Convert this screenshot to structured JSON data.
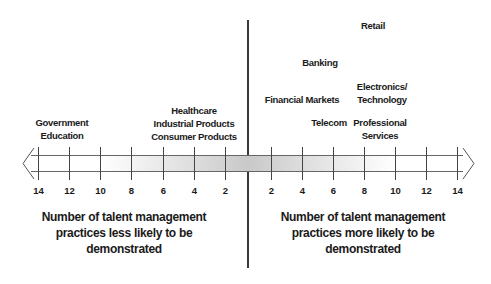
{
  "diagram": {
    "center_line_x": 248,
    "axis": {
      "left_ticks": [
        {
          "label": "14",
          "x": 38
        },
        {
          "label": "12",
          "x": 69
        },
        {
          "label": "10",
          "x": 100
        },
        {
          "label": "8",
          "x": 131
        },
        {
          "label": "6",
          "x": 163
        },
        {
          "label": "4",
          "x": 194
        },
        {
          "label": "2",
          "x": 225
        }
      ],
      "right_ticks": [
        {
          "label": "2",
          "x": 271
        },
        {
          "label": "4",
          "x": 302
        },
        {
          "label": "6",
          "x": 333
        },
        {
          "label": "8",
          "x": 364
        },
        {
          "label": "10",
          "x": 395
        },
        {
          "label": "12",
          "x": 426
        },
        {
          "label": "14",
          "x": 457
        }
      ],
      "band_center_color": "#c9c9c9"
    },
    "left_labels": [
      {
        "lines": [
          "Government",
          "Education"
        ],
        "x": 62,
        "y": 116
      },
      {
        "lines": [
          "Healthcare",
          "Industrial Products",
          "Consumer Products"
        ],
        "x": 194,
        "y": 104
      }
    ],
    "right_labels": [
      {
        "lines": [
          "Retail"
        ],
        "x": 373,
        "y": 19
      },
      {
        "lines": [
          "Banking"
        ],
        "x": 320,
        "y": 56
      },
      {
        "lines": [
          "Financial Markets"
        ],
        "x": 302,
        "y": 93
      },
      {
        "lines": [
          "Electronics/",
          "Technology"
        ],
        "x": 382,
        "y": 80
      },
      {
        "lines": [
          "Telecom"
        ],
        "x": 329,
        "y": 116
      },
      {
        "lines": [
          "Professional",
          "Services"
        ],
        "x": 380,
        "y": 116
      }
    ],
    "captions": {
      "left": [
        "Number of talent management",
        "practices less likely to be",
        "demonstrated"
      ],
      "right": [
        "Number of talent management",
        "practices more likely to be",
        "demonstrated"
      ]
    }
  }
}
